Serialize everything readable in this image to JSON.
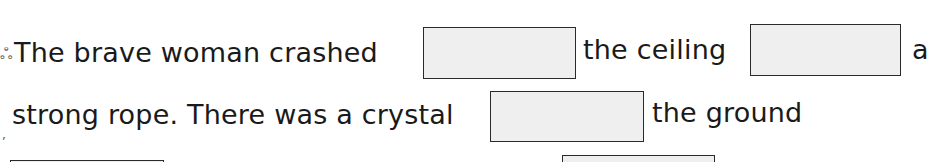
{
  "worksheet": {
    "line1": {
      "part1": "The brave woman crashed",
      "part2": "the ceiling",
      "part3": "a"
    },
    "line2": {
      "part1": "strong rope. There was a crystal",
      "part2": "the ground"
    },
    "blanks": [
      {
        "id": 1,
        "value": ""
      },
      {
        "id": 2,
        "value": ""
      },
      {
        "id": 3,
        "value": ""
      },
      {
        "id": 4,
        "value": ""
      },
      {
        "id": 5,
        "value": ""
      }
    ]
  },
  "colors": {
    "blank_fill": "#efefef",
    "blank_border": "#2a2a2a",
    "text": "#1a1a1a"
  }
}
